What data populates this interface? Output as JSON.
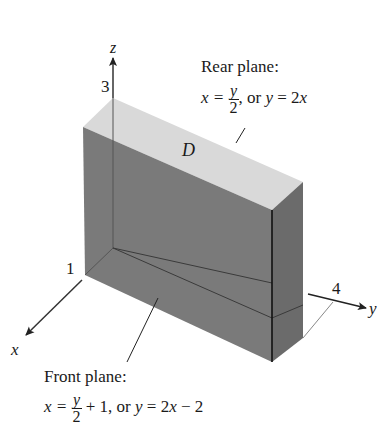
{
  "figure": {
    "axes": {
      "z": {
        "label": "z",
        "tick": "3"
      },
      "x": {
        "label": "x",
        "tick": "1"
      },
      "y": {
        "label": "y",
        "tick": "4"
      }
    },
    "region_label": "D",
    "rear_plane": {
      "title": "Rear plane:",
      "lhs": "x =",
      "frac_num": "y",
      "frac_den": "2",
      "rest": ", or ",
      "alt_y": "y",
      "alt_rest": " = 2",
      "alt_x": "x"
    },
    "front_plane": {
      "title": "Front plane:",
      "lhs": "x =",
      "frac_num": "y",
      "frac_den": "2",
      "rest": " + 1, or ",
      "alt_y": "y",
      "alt_rest": " = 2",
      "alt_x": "x",
      "alt_tail": " − 2"
    },
    "colors": {
      "top_face": "#d9d9d9",
      "front_face": "#7a7a7a",
      "side_face": "#6e6e6e",
      "edge": "#111111",
      "axis": "#333333"
    }
  }
}
